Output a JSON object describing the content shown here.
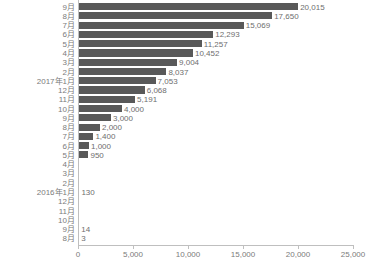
{
  "chart_data": {
    "type": "bar",
    "orientation": "horizontal",
    "title": "",
    "xlabel": "",
    "ylabel": "",
    "xlim": [
      0,
      25000
    ],
    "grid": false,
    "legend": false,
    "bar_color": "#595959",
    "axis_color": "#bfbfbf",
    "label_color": "#7b7b7b",
    "xticks": [
      0,
      5000,
      10000,
      15000,
      20000,
      25000
    ],
    "xtick_labels": [
      "0",
      "5,000",
      "10,000",
      "15,000",
      "20,000",
      "25,000"
    ],
    "categories": [
      "9月",
      "8月",
      "7月",
      "6月",
      "5月",
      "4月",
      "3月",
      "2月",
      "2017年1月",
      "12月",
      "11月",
      "10月",
      "9月",
      "8月",
      "7月",
      "6月",
      "5月",
      "4月",
      "3月",
      "2月",
      "2016年1月",
      "12月",
      "11月",
      "10月",
      "9月",
      "8月"
    ],
    "values": [
      20015,
      17650,
      15069,
      12293,
      11257,
      10452,
      9004,
      8037,
      7053,
      6068,
      5191,
      4000,
      3000,
      2000,
      1400,
      1000,
      950,
      0,
      0,
      0,
      130,
      0,
      0,
      0,
      14,
      3
    ],
    "data_labels": [
      "20,015",
      "17,650",
      "15,069",
      "12,293",
      "11,257",
      "10,452",
      "9,004",
      "8,037",
      "7,053",
      "6,068",
      "5,191",
      "4,000",
      "3,000",
      "2,000",
      "1,400",
      "1,000",
      "950",
      "",
      "",
      "",
      "130",
      "",
      "",
      "",
      "14",
      "3"
    ]
  }
}
